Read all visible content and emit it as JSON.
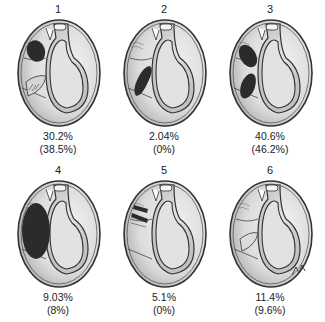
{
  "figure": {
    "panels": [
      {
        "number": "1",
        "value": "30.2%",
        "paren": "(38.5%)",
        "lesion": "superior-anterior dark oval and anterior-inferior hatched region"
      },
      {
        "number": "2",
        "value": "2.04%",
        "paren": "(0%)",
        "lesion": "anterior-inferior dark elongated lesion"
      },
      {
        "number": "3",
        "value": "40.6%",
        "paren": "(46.2%)",
        "lesion": "two dark ovals superior and inferior anterior"
      },
      {
        "number": "4",
        "value": "9.03%",
        "paren": "(8%)",
        "lesion": "large dark anterior lesion"
      },
      {
        "number": "5",
        "value": "5.1%",
        "paren": "(0%)",
        "lesion": "small dark striped lesions anterior-superior"
      },
      {
        "number": "6",
        "value": "11.4%",
        "paren": "(9.6%)",
        "lesion": "no dark lesion, hatched anterior"
      }
    ],
    "signature": "artist signature"
  }
}
